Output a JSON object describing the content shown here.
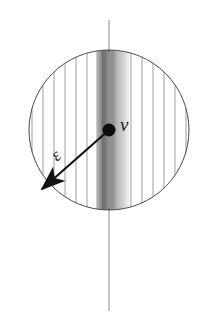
{
  "figure": {
    "canvas": {
      "width": 211,
      "height": 328,
      "background": "#ffffff"
    },
    "labels": {
      "velocity": "v",
      "epsilon": "ε"
    },
    "colors": {
      "outline": "#4a4a4a",
      "axis_line": "#8a8a8a",
      "hatch_light": "#9a9a9a",
      "hatch_dark": "#3c3c3c",
      "arrow": "#111111",
      "dot": "#0d0d0d",
      "label": "#1a1a1a"
    },
    "geometry": {
      "circle": {
        "cx": 109,
        "cy": 130,
        "r": 80,
        "stroke_width": 1
      },
      "axis": {
        "x": 109,
        "y_top": 20,
        "y_bottom": 311,
        "stroke_width": 1
      },
      "center_dot": {
        "cx": 109,
        "cy": 130,
        "r": 6.5
      },
      "arrow": {
        "x1": 109,
        "y1": 130,
        "x2": 42,
        "y2": 189,
        "stroke_width": 2.1,
        "head_length": 13,
        "head_width": 9,
        "double_headed": true
      },
      "label_positions": {
        "velocity": {
          "x": 120,
          "y": 131,
          "font_size": 19
        },
        "epsilon": {
          "x": 57,
          "y": 162,
          "font_size": 18,
          "rotate": -42
        }
      },
      "dense_band": {
        "x_start": 97,
        "x_end": 129,
        "peak_x": 106
      }
    },
    "hatching": {
      "description": "Vertical line fill clipped to the disk; sparse toward edges, very dense and dark in a narrow band just right of the axis",
      "sparse_spacing": 11,
      "dense_spacing": 1.1,
      "line_count_sparse": 14,
      "line_count_dense": 30
    }
  }
}
